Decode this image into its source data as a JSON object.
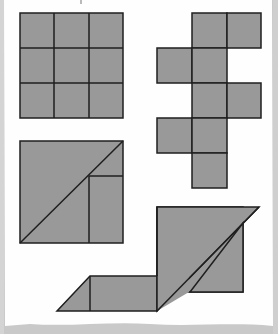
{
  "colors": {
    "paper": "#fefefe",
    "shadow": "#cfcfcf",
    "fill": "#999999",
    "stroke": "#1f1f1f"
  },
  "figures": [
    {
      "id": "grid-3x3",
      "description": "Square divided into 3×3 equal squares"
    },
    {
      "id": "cube-net",
      "description": "Cross-shaped arrangement of 9 unit squares (stair net)"
    },
    {
      "id": "square-dissection",
      "description": "Square with a diagonal and an inner rectangle/triangle dissection"
    },
    {
      "id": "parallelogram-composite",
      "description": "Composite shape of a large parallelogram over a square and a small parallelogram strip"
    }
  ]
}
